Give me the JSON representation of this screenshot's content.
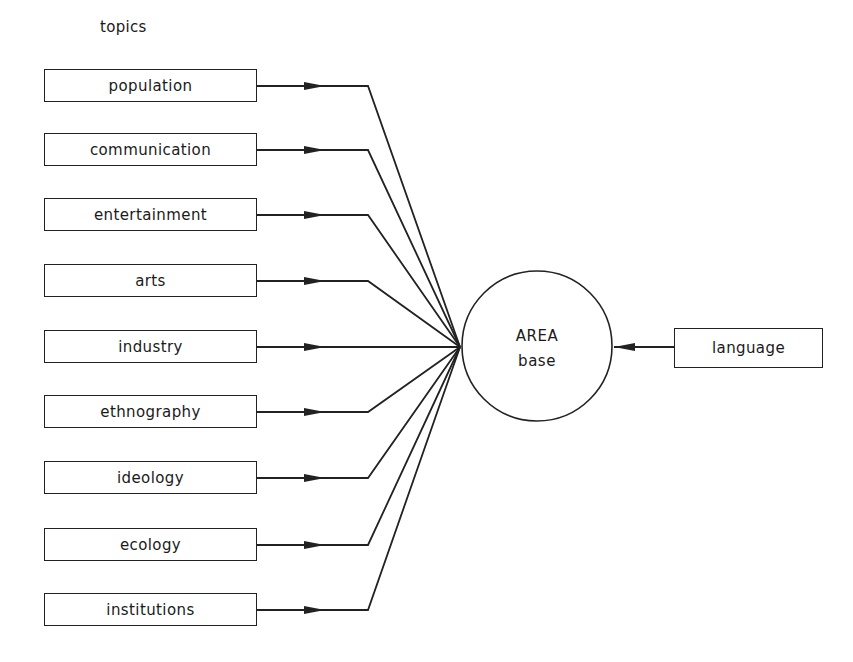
{
  "diagram": {
    "heading": "topics",
    "topics": [
      {
        "label": "population",
        "y": 86
      },
      {
        "label": "communication",
        "y": 150
      },
      {
        "label": "entertainment",
        "y": 215
      },
      {
        "label": "arts",
        "y": 281
      },
      {
        "label": "industry",
        "y": 347
      },
      {
        "label": "ethnography",
        "y": 412
      },
      {
        "label": "ideology",
        "y": 478
      },
      {
        "label": "ecology",
        "y": 545
      },
      {
        "label": "institutions",
        "y": 610
      }
    ],
    "hub": {
      "line1": "AREA",
      "line2": "base",
      "cx": 537,
      "cy": 346,
      "r": 75
    },
    "input": {
      "label": "language"
    },
    "colors": {
      "stroke": "#222222",
      "background": "#ffffff"
    }
  }
}
